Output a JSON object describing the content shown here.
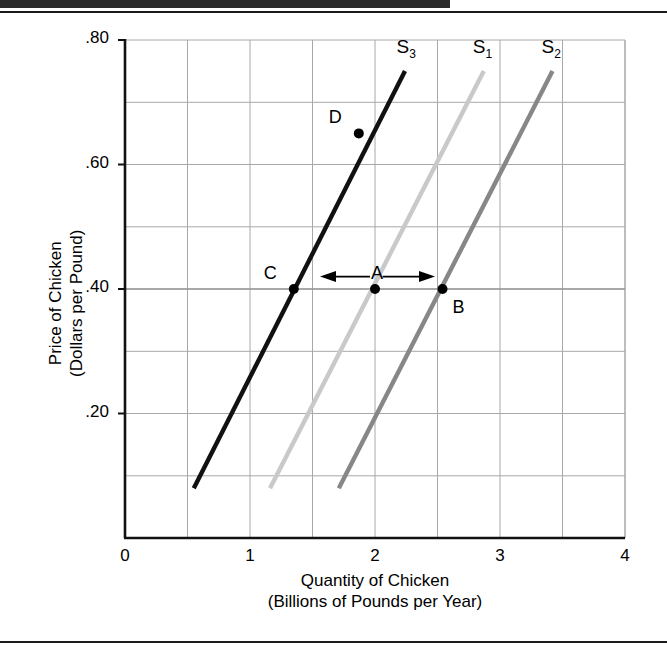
{
  "figure": {
    "has_top_rule": true,
    "has_bottom_rule": true
  },
  "axes": {
    "x": {
      "title_line1": "Quantity of Chicken",
      "title_line2": "(Billions of Pounds per Year)",
      "ticks": [
        "0",
        "1",
        "2",
        "3",
        "4"
      ],
      "tick_values": [
        0,
        1,
        2,
        3,
        4
      ],
      "min": 0,
      "max": 4,
      "minor_step": 0.5
    },
    "y": {
      "title_line1": "Price of Chicken",
      "title_line2": "(Dollars per Pound)",
      "ticks": [
        ".80",
        ".60",
        ".40",
        ".20"
      ],
      "tick_values": [
        0.8,
        0.6,
        0.4,
        0.2
      ],
      "min": 0,
      "max": 0.8,
      "minor_step": 0.1
    }
  },
  "colors": {
    "s1": "#c9c9c9",
    "s2": "#878787",
    "s3": "#111111",
    "grid": "#a8a8a8",
    "axis": "#111111",
    "text": "#000000"
  },
  "chart_data": {
    "type": "line",
    "title": "",
    "xlabel": "Quantity of Chicken (Billions of Pounds per Year)",
    "ylabel": "Price of Chicken (Dollars per Pound)",
    "xlim": [
      0,
      4
    ],
    "ylim": [
      0,
      0.8
    ],
    "grid": true,
    "legend": "inline-curve-labels",
    "series": [
      {
        "name": "S1",
        "label": "S₁",
        "color": "#c9c9c9",
        "points": [
          [
            1.16,
            0.08
          ],
          [
            2.87,
            0.75
          ]
        ],
        "label_pos": [
          2.87,
          0.8
        ]
      },
      {
        "name": "S2",
        "label": "S₂",
        "color": "#878787",
        "points": [
          [
            1.71,
            0.08
          ],
          [
            3.42,
            0.75
          ]
        ],
        "label_pos": [
          3.42,
          0.8
        ]
      },
      {
        "name": "S3",
        "label": "S₃",
        "color": "#111111",
        "points": [
          [
            0.55,
            0.08
          ],
          [
            2.24,
            0.75
          ]
        ],
        "label_pos": [
          2.26,
          0.8
        ]
      }
    ],
    "markers": [
      {
        "name": "A",
        "x": 2.0,
        "y": 0.4,
        "on_series": "S1",
        "label_dx": -4,
        "label_dy": -26
      },
      {
        "name": "B",
        "x": 2.54,
        "y": 0.4,
        "on_series": "S2",
        "label_dx": 10,
        "label_dy": 8
      },
      {
        "name": "C",
        "x": 1.35,
        "y": 0.4,
        "on_series": "S3",
        "label_dx": -30,
        "label_dy": -26
      },
      {
        "name": "D",
        "x": 1.87,
        "y": 0.65,
        "on_series": "S3",
        "label_dx": -30,
        "label_dy": -26
      }
    ],
    "annotations": [
      {
        "name": "arrow-left",
        "from": [
          1.96,
          0.42
        ],
        "to": [
          1.56,
          0.42
        ],
        "direction": "left"
      },
      {
        "name": "arrow-right",
        "from": [
          2.06,
          0.42
        ],
        "to": [
          2.48,
          0.42
        ],
        "direction": "right"
      }
    ],
    "reference_lines": [
      {
        "name": "price-40-line",
        "axis": "y",
        "value": 0.4
      }
    ]
  }
}
